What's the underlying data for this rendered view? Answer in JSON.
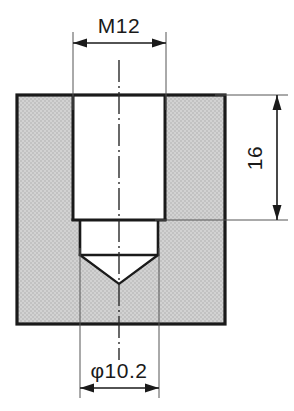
{
  "drawing": {
    "type": "engineering-cross-section",
    "subject": "tapped blind hole in block (sectional view)",
    "background_color": "#ffffff",
    "line_color": "#1a1a1a",
    "fill_color": "#cfcfcf",
    "hatch_color": "#b8b8b8",
    "dimensions": [
      {
        "id": "thread-major-diameter",
        "label": "M12",
        "orientation": "horizontal",
        "position": "top",
        "arrow_style": "double-headed",
        "span_start_x": 72,
        "span_end_x": 166,
        "line_y": 43,
        "text_x": 119,
        "text_y": 26
      },
      {
        "id": "thread-depth",
        "label": "16",
        "orientation": "vertical",
        "position": "right",
        "arrow_style": "double-headed",
        "span_start_y": 95,
        "span_end_y": 220,
        "line_x": 277,
        "text_x": 262,
        "text_y": 158,
        "rotation": -90
      },
      {
        "id": "pilot-hole-diameter",
        "label": "φ10.2",
        "orientation": "horizontal",
        "position": "bottom",
        "arrow_style": "double-headed",
        "span_start_x": 80,
        "span_end_x": 159,
        "line_y": 388,
        "text_x": 119,
        "text_y": 371
      }
    ],
    "geometry": {
      "body": {
        "x": 17,
        "y": 95,
        "width": 208,
        "height": 229
      },
      "threaded_bore": {
        "left_x": 73,
        "right_x": 165,
        "top_y": 95,
        "bottom_y": 220
      },
      "pilot_bore": {
        "left_x": 80,
        "right_x": 159,
        "top_y": 220,
        "flat_bottom_y": 255
      },
      "drill_point": {
        "apex_x": 119,
        "apex_y": 284
      },
      "centerline_x": 119,
      "centerline_top_y": 60,
      "centerline_bottom_y": 360
    },
    "labels": {
      "thread_spec": "M12",
      "depth_spec": "16",
      "pilot_diameter_spec": "φ10.2"
    }
  }
}
